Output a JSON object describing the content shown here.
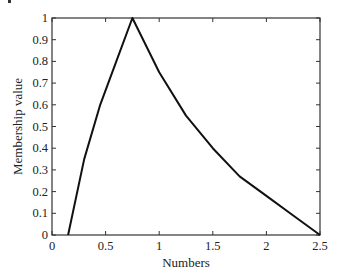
{
  "chart_data": {
    "type": "line",
    "title": "",
    "xlabel": "Numbers",
    "ylabel": "Membership value",
    "xlim": [
      0,
      2.5
    ],
    "ylim": [
      0,
      1
    ],
    "xticks": [
      0,
      0.5,
      1,
      1.5,
      2,
      2.5
    ],
    "xtick_labels": [
      "0",
      "0.5",
      "1",
      "1.5",
      "2",
      "2.5"
    ],
    "yticks": [
      0,
      0.1,
      0.2,
      0.3,
      0.4,
      0.5,
      0.6,
      0.7,
      0.8,
      0.9,
      1
    ],
    "ytick_labels": [
      "0",
      "0.1",
      "0.2",
      "0.3",
      "0.4",
      "0.5",
      "0.6",
      "0.7",
      "0.8",
      "0.9",
      "1"
    ],
    "grid": false,
    "legend": null,
    "series": [
      {
        "name": "membership",
        "color": "#111111",
        "x": [
          0.15,
          0.3,
          0.45,
          0.6,
          0.75,
          1.0,
          1.25,
          1.5,
          1.75,
          2.0,
          2.25,
          2.5
        ],
        "y": [
          0,
          0.35,
          0.6,
          0.8,
          1.0,
          0.75,
          0.55,
          0.4,
          0.27,
          0.18,
          0.09,
          0
        ]
      }
    ]
  },
  "layout": {
    "plot_left": 52,
    "plot_right": 320,
    "plot_top": 18,
    "plot_bottom": 235
  }
}
